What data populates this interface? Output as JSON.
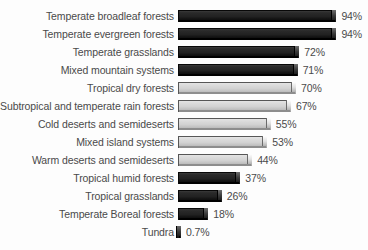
{
  "chart_data": {
    "type": "bar",
    "orientation": "horizontal",
    "title": "",
    "subtitle": "",
    "xlabel": "",
    "ylabel": "",
    "xlim": [
      0,
      100
    ],
    "grid": false,
    "legend": null,
    "value_suffix": "%",
    "categories": [
      "Temperate broadleaf forests",
      "Temperate evergreen forests",
      "Temperate grasslands",
      "Mixed mountain systems",
      "Tropical dry forests",
      "Subtropical and temperate rain forests",
      "Cold deserts and semideserts",
      "Mixed island systems",
      "Warm deserts and semideserts",
      "Tropical humid forests",
      "Tropical grasslands",
      "Temperate Boreal forests",
      "Tundra"
    ],
    "values": [
      94,
      94,
      72,
      71,
      70,
      67,
      55,
      53,
      44,
      37,
      26,
      18,
      0.7
    ],
    "value_labels": [
      "94%",
      "94%",
      "72%",
      "71%",
      "70%",
      "67%",
      "55%",
      "53%",
      "44%",
      "37%",
      "26%",
      "18%",
      "0.7%"
    ],
    "bar_styles": [
      "dark",
      "dark",
      "dark",
      "dark",
      "light",
      "light",
      "light",
      "light",
      "light",
      "dark",
      "dark",
      "dark",
      "dark"
    ],
    "colors": {
      "dark_bar": "#222222",
      "light_bar": "#d2d2d2",
      "bar_outline": "#0a0a0a",
      "text": "#4a4a4a",
      "background": "#fdfdfd"
    }
  },
  "rows": [
    {
      "label": "Temperate broadleaf forests",
      "value": 94,
      "value_label": "94%",
      "style": "dark"
    },
    {
      "label": "Temperate evergreen forests",
      "value": 94,
      "value_label": "94%",
      "style": "dark"
    },
    {
      "label": "Temperate grasslands",
      "value": 72,
      "value_label": "72%",
      "style": "dark"
    },
    {
      "label": "Mixed mountain systems",
      "value": 71,
      "value_label": "71%",
      "style": "dark"
    },
    {
      "label": "Tropical dry forests",
      "value": 70,
      "value_label": "70%",
      "style": "light"
    },
    {
      "label": "Subtropical and temperate rain forests",
      "value": 67,
      "value_label": "67%",
      "style": "light"
    },
    {
      "label": "Cold deserts and semideserts",
      "value": 55,
      "value_label": "55%",
      "style": "light"
    },
    {
      "label": "Mixed island systems",
      "value": 53,
      "value_label": "53%",
      "style": "light"
    },
    {
      "label": "Warm deserts and semideserts",
      "value": 44,
      "value_label": "44%",
      "style": "light"
    },
    {
      "label": "Tropical humid forests",
      "value": 37,
      "value_label": "37%",
      "style": "dark"
    },
    {
      "label": "Tropical grasslands",
      "value": 26,
      "value_label": "26%",
      "style": "dark"
    },
    {
      "label": "Temperate Boreal forests",
      "value": 18,
      "value_label": "18%",
      "style": "dark"
    },
    {
      "label": "Tundra",
      "value": 0.7,
      "value_label": "0.7%",
      "style": "dark"
    }
  ],
  "scale": {
    "px_per_unit": 1.685,
    "min_bar_px": 3
  }
}
